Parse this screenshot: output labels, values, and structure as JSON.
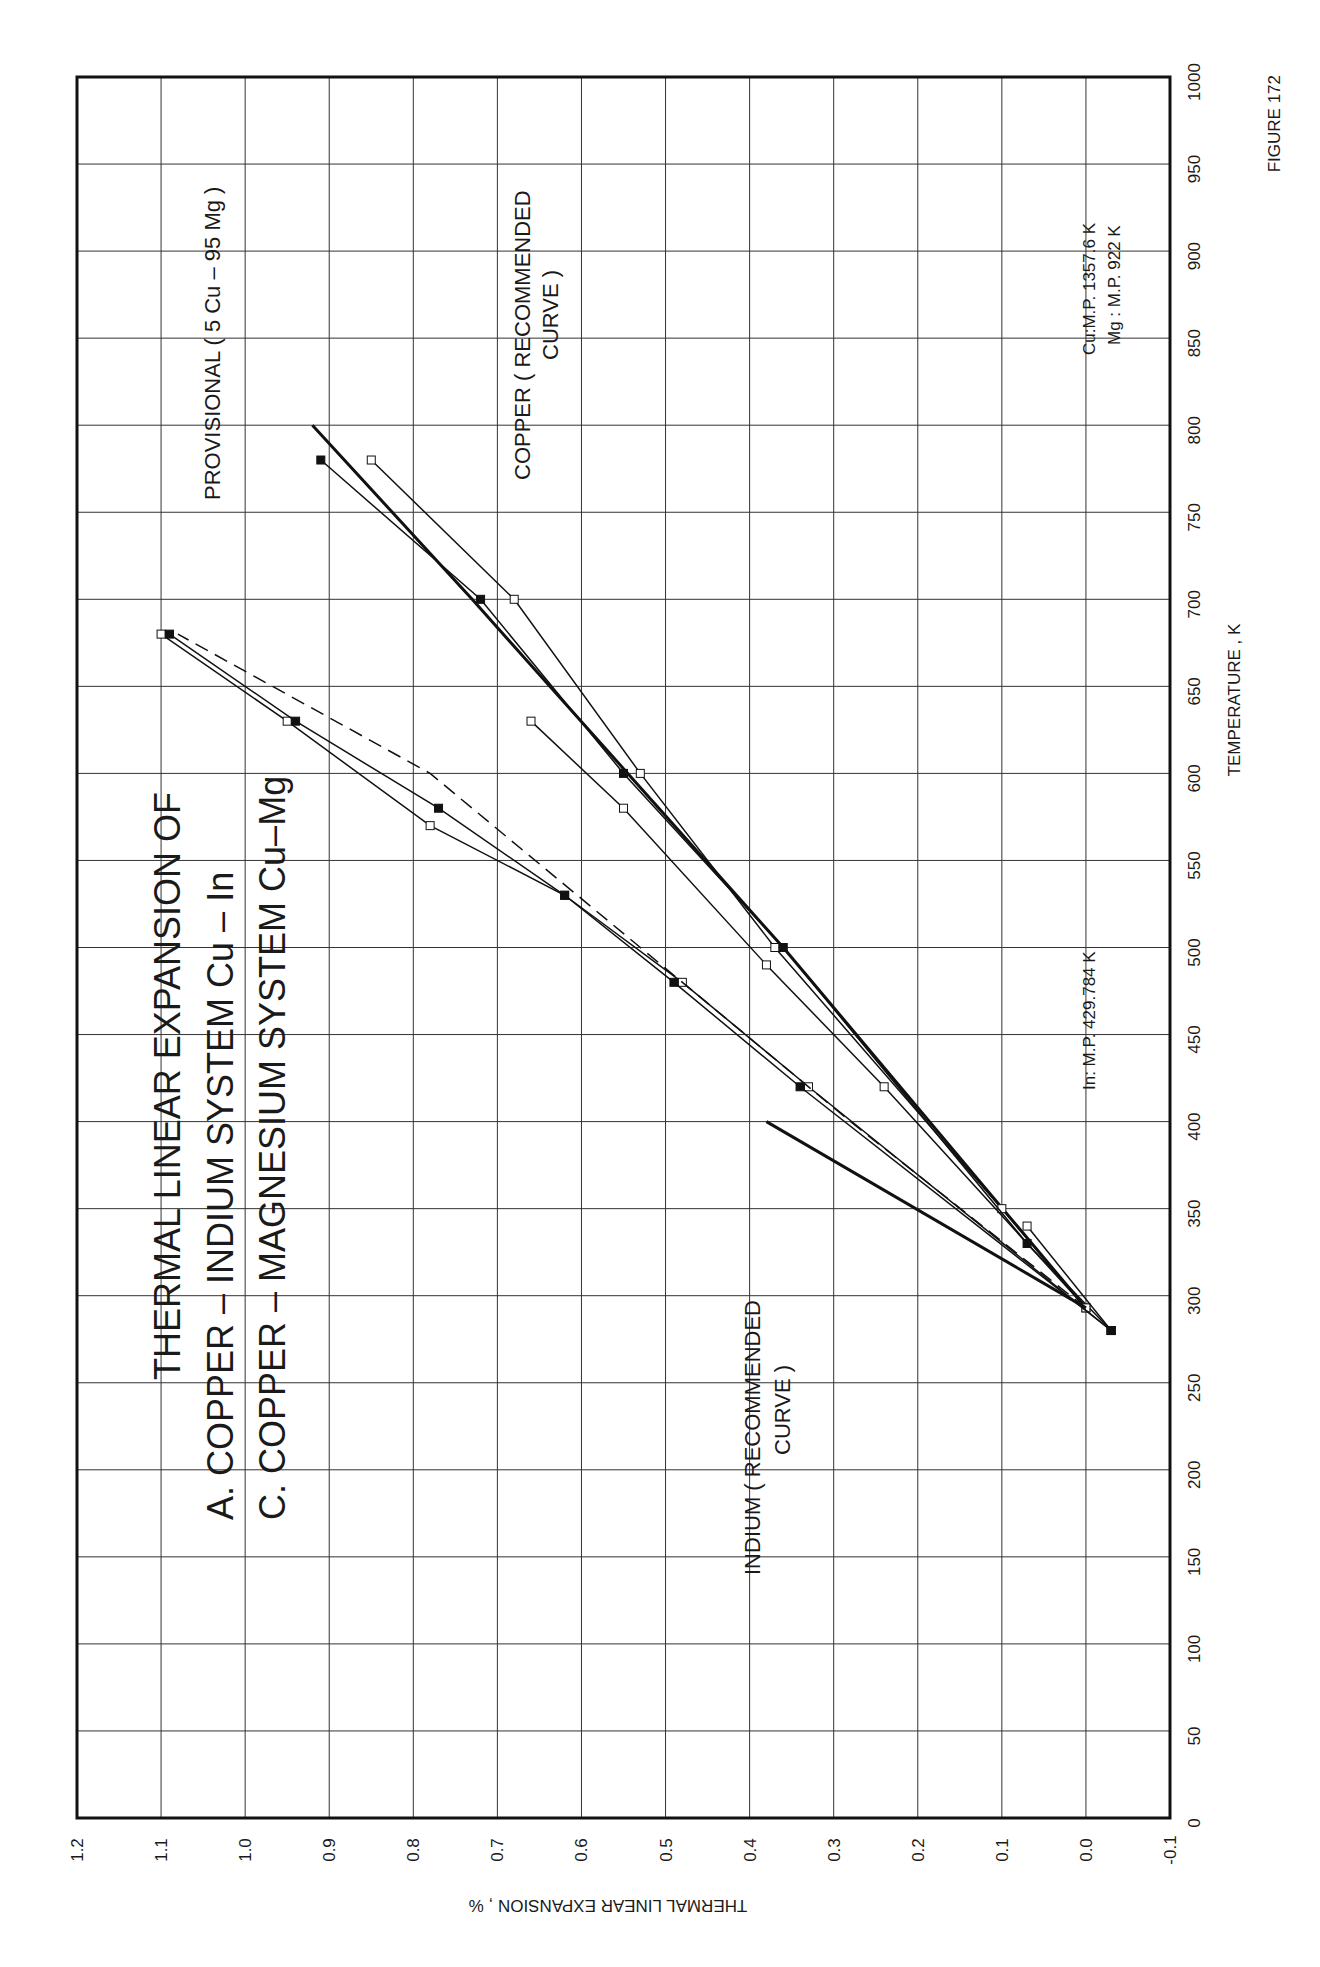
{
  "figure": {
    "label": "FIGURE 172",
    "title_lines": [
      "THERMAL  LINEAR  EXPANSION  OF",
      "A.  COPPER  –  INDIUM  SYSTEM  Cu – In",
      "C.  COPPER  –  MAGNESIUM  SYSTEM  Cu–Mg"
    ],
    "annotations": {
      "provisional": "PROVISIONAL ( 5 Cu  –  95 Mg )",
      "copper_line1": "COPPER ( RECOMMENDED",
      "copper_line2": "CURVE )",
      "indium_line1": "INDIUM  ( RECOMMENDED",
      "indium_line2": "CURVE )",
      "cu_mp": "Cu:M.P.  1357.6  K",
      "mg_mp": "Mg : M.P.  922  K",
      "in_mp": "In:  M.P.  429.784  K",
      "labels": [
        "1A",
        "2A",
        "3A",
        "4A",
        "1C",
        "5C"
      ]
    }
  },
  "chart_data": {
    "type": "line",
    "xlabel": "TEMPERATURE , K",
    "ylabel": "THERMAL LINEAR EXPANSION , %",
    "xlim": [
      0,
      1000
    ],
    "ylim": [
      -0.1,
      1.2
    ],
    "x_ticks": [
      "0",
      "50",
      "100",
      "150",
      "200",
      "250",
      "300",
      "350",
      "400",
      "450",
      "500",
      "550",
      "600",
      "650",
      "700",
      "750",
      "800",
      "850",
      "900",
      "950",
      "1000"
    ],
    "y_ticks": [
      "-0.1",
      "0.0",
      "0.1",
      "0.2",
      "0.3",
      "0.4",
      "0.5",
      "0.6",
      "0.7",
      "0.8",
      "0.9",
      "1.0",
      "1.1",
      "1.2"
    ],
    "grid": true,
    "orientation": "rotated 90° counter-clockwise on page",
    "series": [
      {
        "name": "COPPER (RECOMMENDED CURVE)",
        "style": "thick solid",
        "x": [
          293,
          500,
          700,
          800
        ],
        "y": [
          0.0,
          0.36,
          0.73,
          0.92
        ]
      },
      {
        "name": "1A",
        "marker": "open square",
        "x": [
          293,
          350,
          500,
          600,
          700,
          780
        ],
        "y": [
          0.0,
          0.1,
          0.37,
          0.53,
          0.68,
          0.85
        ]
      },
      {
        "name": "2A",
        "marker": "filled triangle",
        "x": [
          280,
          330,
          500,
          600,
          700,
          780
        ],
        "y": [
          -0.03,
          0.07,
          0.36,
          0.55,
          0.72,
          0.91
        ]
      },
      {
        "name": "3A",
        "marker": "open triangle",
        "x": [
          293,
          420,
          490,
          580,
          630
        ],
        "y": [
          0.0,
          0.24,
          0.38,
          0.55,
          0.66
        ]
      },
      {
        "name": "4A",
        "marker": "open diamond",
        "x": [
          280,
          340
        ],
        "y": [
          -0.03,
          0.07
        ]
      },
      {
        "name": "1C",
        "marker": "open square",
        "x": [
          280,
          420,
          480,
          530,
          570,
          630,
          680
        ],
        "y": [
          -0.03,
          0.33,
          0.48,
          0.62,
          0.78,
          0.95,
          1.1
        ]
      },
      {
        "name": "5C",
        "marker": "filled circle",
        "x": [
          280,
          420,
          480,
          530,
          580,
          630,
          680
        ],
        "y": [
          -0.03,
          0.34,
          0.49,
          0.62,
          0.77,
          0.94,
          1.09
        ]
      },
      {
        "name": "PROVISIONAL (5 Cu - 95 Mg)",
        "style": "dashed",
        "x": [
          293,
          400,
          500,
          600,
          680
        ],
        "y": [
          0.0,
          0.28,
          0.53,
          0.78,
          1.08
        ]
      },
      {
        "name": "INDIUM (RECOMMENDED CURVE)",
        "style": "thick solid",
        "x": [
          293,
          400
        ],
        "y": [
          0.0,
          0.38
        ]
      }
    ],
    "markers_on_axis": [
      {
        "label": "In: M.P. 429.784 K",
        "x": 429.784
      },
      {
        "label": "Mg: M.P. 922 K",
        "x": 922
      },
      {
        "label": "Cu: M.P. 1357.6 K",
        "x": 1357.6,
        "note": "off-scale arrow"
      }
    ]
  }
}
